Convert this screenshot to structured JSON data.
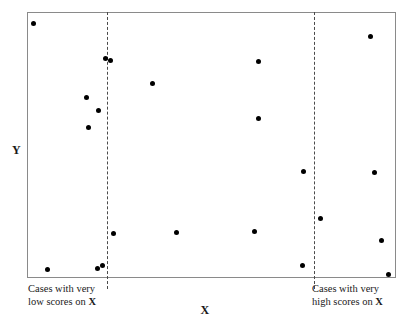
{
  "chart_data": {
    "type": "scatter",
    "title": "",
    "xlabel": "X",
    "ylabel": "Y",
    "xlim": [
      0,
      100
    ],
    "ylim": [
      0,
      100
    ],
    "grid": false,
    "legend": null,
    "marker_color": "#000000",
    "frame_color": "#8a8a8a",
    "cutline_color": "#4a4a4a",
    "cutlines": [
      {
        "name": "low-score-cut",
        "x": 21.4
      },
      {
        "name": "high-score-cut",
        "x": 78.0
      }
    ],
    "points": [
      {
        "x": 1.6,
        "y": 96.2
      },
      {
        "x": 21.1,
        "y": 82.6
      },
      {
        "x": 22.6,
        "y": 82.0
      },
      {
        "x": 16.0,
        "y": 68.0
      },
      {
        "x": 19.2,
        "y": 63.2
      },
      {
        "x": 16.5,
        "y": 56.8
      },
      {
        "x": 34.0,
        "y": 73.2
      },
      {
        "x": 62.7,
        "y": 81.8
      },
      {
        "x": 62.7,
        "y": 60.0
      },
      {
        "x": 93.2,
        "y": 91.1
      },
      {
        "x": 75.2,
        "y": 39.8
      },
      {
        "x": 94.3,
        "y": 39.5
      },
      {
        "x": 79.6,
        "y": 22.1
      },
      {
        "x": 23.3,
        "y": 16.5
      },
      {
        "x": 40.4,
        "y": 17.0
      },
      {
        "x": 61.8,
        "y": 17.4
      },
      {
        "x": 96.2,
        "y": 13.9
      },
      {
        "x": 5.4,
        "y": 3.0
      },
      {
        "x": 18.9,
        "y": 3.4
      },
      {
        "x": 20.2,
        "y": 4.3
      },
      {
        "x": 74.8,
        "y": 4.5
      },
      {
        "x": 98.1,
        "y": 0.8
      }
    ]
  },
  "axes": {
    "y_label": "Y",
    "x_label": "X"
  },
  "annotations": {
    "low": {
      "line1": "Cases with very",
      "line2_prefix": "low scores on ",
      "line2_variable": "X"
    },
    "high": {
      "line1": "Cases with very",
      "line2_prefix": "high scores on ",
      "line2_variable": "X"
    }
  }
}
